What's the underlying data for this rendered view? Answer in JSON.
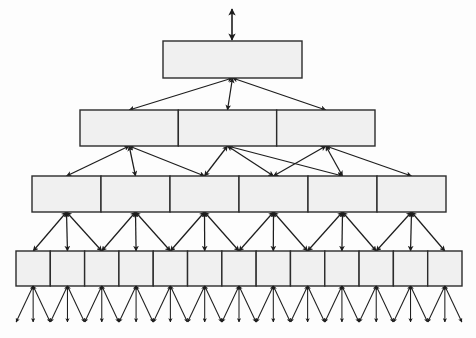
{
  "diagram": {
    "type": "tree-hierarchy",
    "orientation": "top-down",
    "canvas": {
      "width": 476,
      "height": 338,
      "background": "#fdfdfd"
    },
    "style": {
      "node_fill": "#f0f0f0",
      "node_stroke": "#2b2b2b",
      "edge_color": "#1d1d1d",
      "arrowhead": "double-ended",
      "node_stroke_width": 1.4,
      "edge_stroke_width": 1.25
    },
    "root_stem": {
      "label": "root-inbound-arrow",
      "x": 232,
      "y_top": 9,
      "y_bottom": 40,
      "double_headed": true
    },
    "levels": [
      {
        "index": 0,
        "name": "level-1-root",
        "cell_count": 1,
        "x_start": 163,
        "x_end": 302,
        "y_top": 41,
        "y_bottom": 78,
        "cells": [
          {
            "label": ""
          }
        ]
      },
      {
        "index": 1,
        "name": "level-2",
        "cell_count": 3,
        "x_start": 80,
        "x_end": 375,
        "y_top": 110,
        "y_bottom": 146,
        "cells": [
          {
            "label": ""
          },
          {
            "label": ""
          },
          {
            "label": ""
          }
        ]
      },
      {
        "index": 2,
        "name": "level-3",
        "cell_count": 6,
        "x_start": 32,
        "x_end": 446,
        "y_top": 176,
        "y_bottom": 212,
        "cells": [
          {
            "label": ""
          },
          {
            "label": ""
          },
          {
            "label": ""
          },
          {
            "label": ""
          },
          {
            "label": ""
          },
          {
            "label": ""
          }
        ]
      },
      {
        "index": 3,
        "name": "level-4-leaf-row",
        "cell_count": 13,
        "x_start": 16,
        "x_end": 462,
        "y_top": 251,
        "y_bottom": 286,
        "cells": [
          {
            "label": ""
          },
          {
            "label": ""
          },
          {
            "label": ""
          },
          {
            "label": ""
          },
          {
            "label": ""
          },
          {
            "label": ""
          },
          {
            "label": ""
          },
          {
            "label": ""
          },
          {
            "label": ""
          },
          {
            "label": ""
          },
          {
            "label": ""
          },
          {
            "label": ""
          },
          {
            "label": ""
          }
        ]
      }
    ],
    "terminal_fan": {
      "name": "leaf-terminal-arrows",
      "per_cell": 3,
      "spread": 17,
      "length": 36,
      "y_start": 286,
      "y_end": 322,
      "double_headed": true
    },
    "edges": {
      "branching_factor": 3,
      "level_1_to_2": {
        "from": "root-bottom-center",
        "to_count": 3
      },
      "level_2_to_3": {
        "from_count": 3,
        "to_count": 6,
        "fan": 3
      },
      "level_3_to_4": {
        "from_count": 6,
        "to_count": 13,
        "fan": 3
      },
      "level_4_to_leaves": {
        "from_count": 13,
        "to_count": 39,
        "fan": 3
      }
    }
  }
}
